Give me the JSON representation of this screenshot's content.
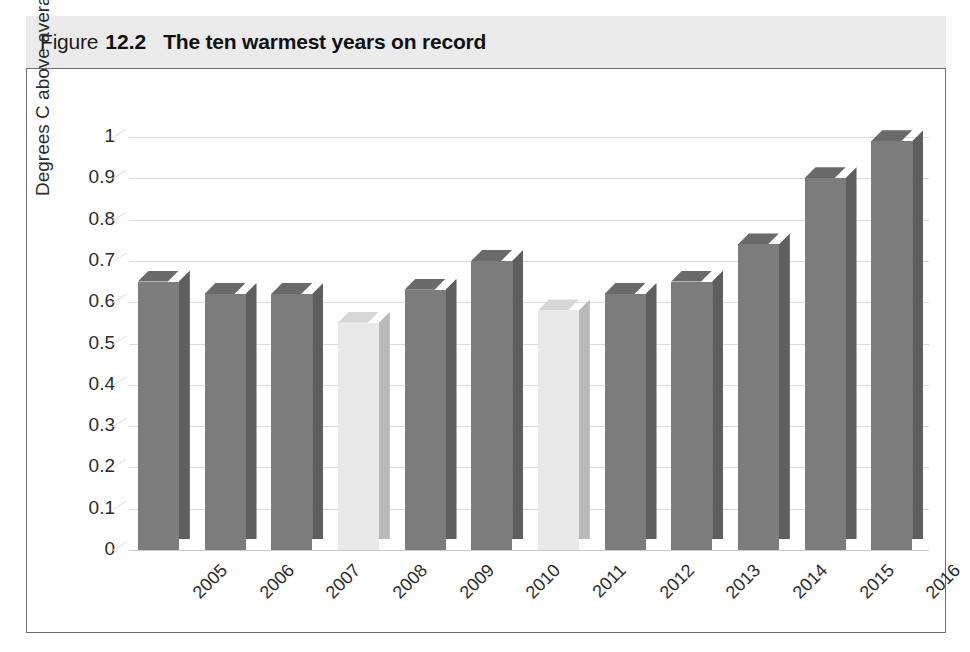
{
  "figure": {
    "label": "Figure",
    "number": "12.2",
    "title": "The ten warmest years on record"
  },
  "chart_data": {
    "type": "bar",
    "title": "The ten warmest years on record",
    "xlabel": "",
    "ylabel": "Degrees C above average",
    "categories": [
      "2005",
      "2006",
      "2007",
      "2008",
      "2009",
      "2010",
      "2011",
      "2012",
      "2013",
      "2014",
      "2015",
      "2016"
    ],
    "values": [
      0.65,
      0.62,
      0.62,
      0.55,
      0.63,
      0.7,
      0.58,
      0.62,
      0.65,
      0.74,
      0.9,
      0.99
    ],
    "bar_styles": [
      "dark",
      "dark",
      "dark",
      "light",
      "dark",
      "dark",
      "light",
      "dark",
      "dark",
      "dark",
      "dark",
      "dark"
    ],
    "ylim": [
      0,
      1
    ],
    "ytick_labels": [
      "1",
      "0.9",
      "0.8",
      "0.7",
      "0.6",
      "0.5",
      "0.4",
      "0.3",
      "0.2",
      "0.1",
      "0"
    ],
    "ytick_values": [
      1,
      0.9,
      0.8,
      0.7,
      0.6,
      0.5,
      0.4,
      0.3,
      0.2,
      0.1,
      0
    ],
    "grid": true,
    "legend": null,
    "colors": {
      "bar_dark": "#7c7c7c",
      "bar_dark_side": "#5e5e5e",
      "bar_light": "#e9e9e9",
      "bar_light_side": "#b9b9b9",
      "gridline": "#dcdcdc",
      "caption_band": "#ebebeb",
      "frame": "#6d6d6d",
      "text": "#2b2b2b"
    }
  }
}
